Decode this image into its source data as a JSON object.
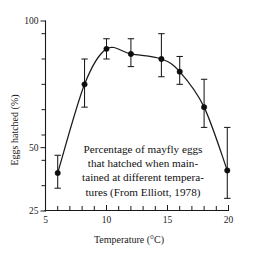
{
  "chart_data": {
    "type": "line",
    "title": "",
    "xlabel": "Temperature (°C)",
    "ylabel": "Eggs hatched (%)",
    "xlim": [
      5,
      20
    ],
    "ylim": [
      25,
      100
    ],
    "grid": false,
    "legend": "none",
    "x_ticks_major": [
      "5",
      "10",
      "15",
      "20"
    ],
    "x_tick_major_values": [
      5,
      10,
      15,
      20
    ],
    "x_tick_minor_values": [
      6,
      7,
      8,
      9,
      11,
      12,
      13,
      14,
      16,
      17,
      18,
      19
    ],
    "y_ticks_major": [
      "25",
      "50",
      "100"
    ],
    "y_tick_major_values": [
      25,
      50,
      100
    ],
    "y_tick_minor_values": [
      35,
      45,
      55,
      65,
      75,
      85,
      95
    ],
    "series": [
      {
        "name": "Eggs hatched",
        "marker": "filled-circle",
        "x": [
          6.0,
          8.2,
          10.0,
          12.0,
          14.5,
          16.0,
          18.0,
          19.9
        ],
        "values": [
          40,
          75,
          89,
          87,
          85,
          80,
          66,
          41
        ],
        "err_low": [
          34,
          66,
          85,
          82,
          78,
          75,
          58,
          30
        ],
        "err_high": [
          47,
          85,
          93,
          93,
          95,
          86,
          77,
          58
        ]
      }
    ],
    "caption_lines": [
      "Percentage of mayfly eggs",
      "that hatched when main-",
      "tained at different tempera-",
      "tures (From Elliott, 1978)"
    ],
    "colors": {
      "ink": "#1a1a1a",
      "marker": "#0d0d0d",
      "background": "#ffffff"
    }
  }
}
